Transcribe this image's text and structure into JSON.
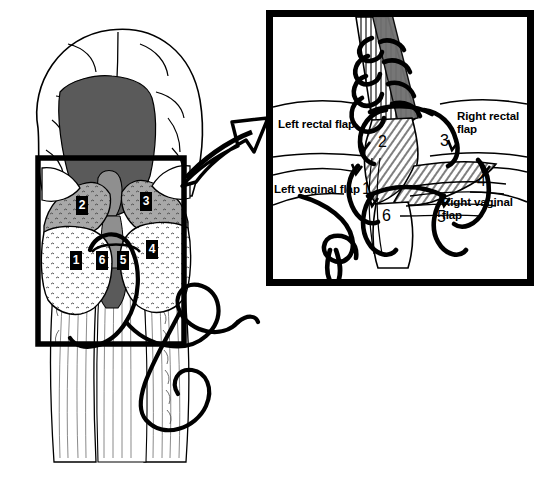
{
  "figure": {
    "type": "medical-surgical-illustration",
    "background_color": "#ffffff",
    "ink_color": "#000000"
  },
  "overview": {
    "name": "perineum-overview",
    "colors": {
      "skin": "#ffffff",
      "dark_cavity": "#5a5a5a",
      "mid_cavity": "#8f8f8f",
      "tissue_gray": "#a8a8a8",
      "outline": "#000000"
    },
    "focus_rect": {
      "x": 38,
      "y": 158,
      "w": 146,
      "h": 186
    },
    "tags": [
      {
        "label": "1",
        "x": 70,
        "y": 251
      },
      {
        "label": "2",
        "x": 76,
        "y": 196
      },
      {
        "label": "3",
        "x": 140,
        "y": 192
      },
      {
        "label": "4",
        "x": 146,
        "y": 240
      },
      {
        "label": "5",
        "x": 117,
        "y": 251
      },
      {
        "label": "6",
        "x": 96,
        "y": 251
      }
    ]
  },
  "arrow": {
    "name": "magnify-arrow",
    "direction": "up-right",
    "fill": "#ffffff",
    "stroke": "#000000"
  },
  "inset": {
    "name": "magnified-detail-panel",
    "frame": {
      "x": 266,
      "y": 10,
      "w": 268,
      "h": 276,
      "border_width": 7
    },
    "labels": [
      {
        "id": "left-rectal-flap",
        "text": "Left rectal flap",
        "x": 278,
        "y": 118
      },
      {
        "id": "right-rectal-flap",
        "text": "Right rectal\nflap",
        "x": 457,
        "y": 110
      },
      {
        "id": "left-vaginal-flap",
        "text": "Left vaginal flap",
        "x": 274,
        "y": 183
      },
      {
        "id": "right-vaginal-flap",
        "text": "Right vaginal\nflap",
        "x": 442,
        "y": 196
      }
    ],
    "numbers": [
      {
        "label": "1",
        "x": 362,
        "y": 180
      },
      {
        "label": "2",
        "x": 378,
        "y": 133
      },
      {
        "label": "3",
        "x": 440,
        "y": 132
      },
      {
        "label": "4",
        "x": 477,
        "y": 172
      },
      {
        "label": "5",
        "x": 437,
        "y": 208
      },
      {
        "label": "6",
        "x": 382,
        "y": 207
      }
    ]
  }
}
